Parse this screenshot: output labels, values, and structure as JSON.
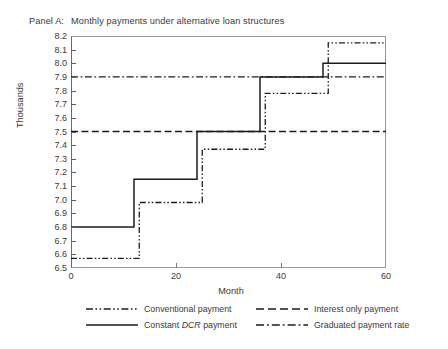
{
  "panel": {
    "tag": "Panel A:",
    "title": "Monthly payments under alternative loan structures"
  },
  "chart_data": {
    "type": "line",
    "title": "Monthly payments under alternative loan structures",
    "xlabel": "Month",
    "ylabel": "Thousands",
    "xlim": [
      0,
      60
    ],
    "ylim": [
      6.5,
      8.2
    ],
    "xticks": [
      0,
      20,
      40,
      60
    ],
    "yticks": [
      6.5,
      6.6,
      6.7,
      6.8,
      6.9,
      7.0,
      7.1,
      7.2,
      7.3,
      7.4,
      7.5,
      7.6,
      7.7,
      7.8,
      7.9,
      8.0,
      8.1,
      8.2
    ],
    "grid": false,
    "legend_position": "below",
    "series": [
      {
        "name": "Conventional payment",
        "style": "dash-dot-dot",
        "shape": "step",
        "x": [
          0,
          13,
          13,
          25,
          25,
          37,
          37,
          49,
          49,
          60
        ],
        "y": [
          6.57,
          6.57,
          6.98,
          6.98,
          7.37,
          7.37,
          7.78,
          7.78,
          8.15,
          8.15
        ]
      },
      {
        "name": "Constant DCR payment",
        "style": "solid",
        "shape": "step",
        "x": [
          0,
          12,
          12,
          24,
          24,
          36,
          36,
          48,
          48,
          60
        ],
        "y": [
          6.8,
          6.8,
          7.15,
          7.15,
          7.5,
          7.5,
          7.9,
          7.9,
          8.0,
          8.0
        ]
      },
      {
        "name": "Interest only payment",
        "style": "dashed",
        "shape": "constant",
        "x": [
          0,
          60
        ],
        "y": [
          7.5,
          7.5
        ]
      },
      {
        "name": "Graduated payment rate",
        "style": "dash-dot",
        "shape": "constant",
        "x": [
          0,
          60
        ],
        "y": [
          7.9,
          7.9
        ]
      }
    ]
  },
  "axes": {
    "y_title": "Thousands",
    "x_title": "Month",
    "y_labels": [
      "8.2",
      "8.1",
      "8.0",
      "7.9",
      "7.8",
      "7.7",
      "7.6",
      "7.5",
      "7.4",
      "7.3",
      "7.2",
      "7.1",
      "7.0",
      "6.9",
      "6.8",
      "6.7",
      "6.6",
      "6.5"
    ],
    "x_labels": [
      "0",
      "20",
      "40",
      "60"
    ]
  },
  "legend": {
    "items": [
      {
        "label": "Conventional payment",
        "style": "dash-dot-dot"
      },
      {
        "label": "Constant DCR payment",
        "style": "solid",
        "italic_word": "DCR"
      },
      {
        "label": "Interest only payment",
        "style": "dashed"
      },
      {
        "label": "Graduated payment rate",
        "style": "dash-dot"
      }
    ]
  },
  "colors": {
    "line": "#1c1c1c",
    "axis": "#6a6a6a",
    "text": "#3a3a3a",
    "background": "#ffffff"
  }
}
